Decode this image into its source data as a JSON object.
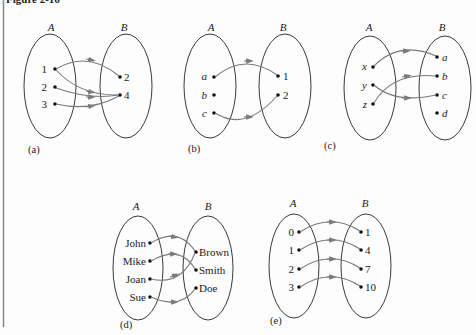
{
  "figure": {
    "title": "Figure 2-16",
    "border_color": "#888888",
    "arrow_color": "#7a7a7a",
    "ellipse_color": "#3a3a3a"
  },
  "panels": [
    {
      "id": "a",
      "caption": "(a)",
      "set_a_label": "A",
      "set_b_label": "B",
      "domain": [
        "1",
        "2",
        "3"
      ],
      "codomain": [
        "2",
        "4"
      ],
      "italic_elements": false,
      "mapping": [
        [
          "1",
          "2"
        ],
        [
          "1",
          "4"
        ],
        [
          "2",
          "4"
        ],
        [
          "3",
          "4"
        ]
      ]
    },
    {
      "id": "b",
      "caption": "(b)",
      "set_a_label": "A",
      "set_b_label": "B",
      "domain": [
        "a",
        "b",
        "c"
      ],
      "codomain": [
        "1",
        "2"
      ],
      "italic_elements": true,
      "mapping": [
        [
          "a",
          "1"
        ],
        [
          "c",
          "2"
        ]
      ]
    },
    {
      "id": "c",
      "caption": "(c)",
      "set_a_label": "A",
      "set_b_label": "B",
      "domain": [
        "x",
        "y",
        "z"
      ],
      "codomain": [
        "a",
        "b",
        "c",
        "d"
      ],
      "italic_elements": true,
      "mapping": [
        [
          "x",
          "a"
        ],
        [
          "y",
          "c"
        ],
        [
          "z",
          "b"
        ]
      ]
    },
    {
      "id": "d",
      "caption": "(d)",
      "set_a_label": "A",
      "set_b_label": "B",
      "domain": [
        "John",
        "Mike",
        "Joan",
        "Sue"
      ],
      "codomain": [
        "Brown",
        "Smith",
        "Doe"
      ],
      "italic_elements": false,
      "mapping": [
        [
          "John",
          "Brown"
        ],
        [
          "Mike",
          "Smith"
        ],
        [
          "Joan",
          "Brown"
        ],
        [
          "Sue",
          "Doe"
        ]
      ]
    },
    {
      "id": "e",
      "caption": "(e)",
      "set_a_label": "A",
      "set_b_label": "B",
      "domain": [
        "0",
        "1",
        "2",
        "3"
      ],
      "codomain": [
        "1",
        "4",
        "7",
        "10"
      ],
      "italic_elements": false,
      "mapping": [
        [
          "0",
          "1"
        ],
        [
          "1",
          "4"
        ],
        [
          "2",
          "7"
        ],
        [
          "3",
          "10"
        ]
      ]
    }
  ]
}
